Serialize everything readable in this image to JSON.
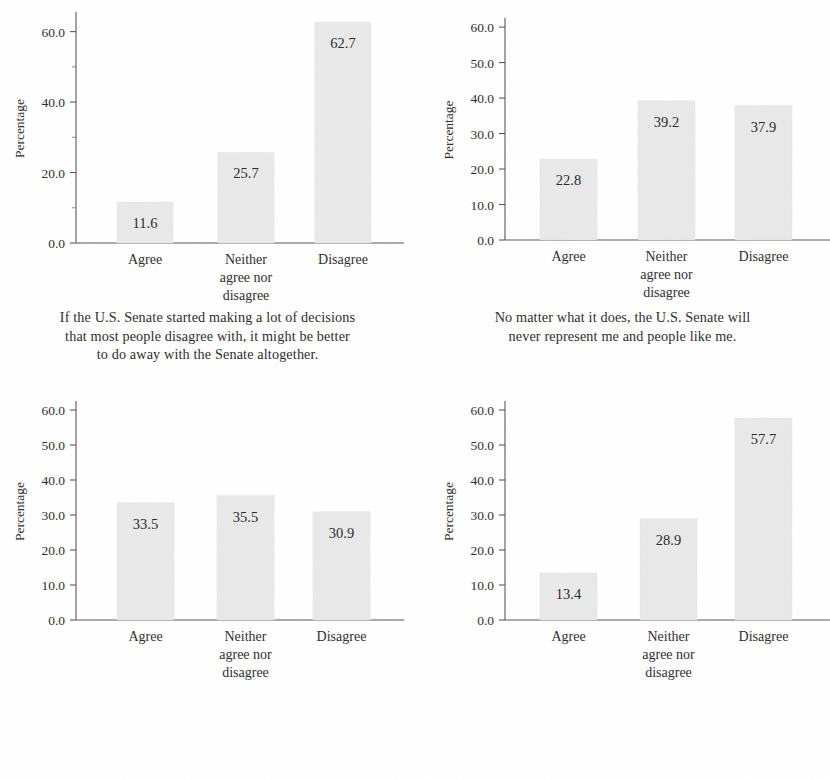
{
  "figure": {
    "background_color": "#ffffff",
    "bar_fill_color": "#e9e9e9",
    "axis_color": "#585858",
    "text_color": "#2e2e2e",
    "y_axis_title": "Percentage",
    "categories": [
      "Agree",
      "Neither agree nor disagree",
      "Disagree"
    ],
    "category_lines": [
      [
        "Agree"
      ],
      [
        "Neither",
        "agree nor",
        "disagree"
      ],
      [
        "Disagree"
      ]
    ]
  },
  "chart_data": [
    {
      "type": "bar",
      "panel": "top-left",
      "title": "",
      "caption": "If the U.S. Senate started making a lot of decisions that most people disagree with, it might be better to do away with the Senate altogether.",
      "caption_lines": [
        "If the U.S. Senate started making a lot of decisions",
        "that most people disagree with, it might be better",
        "to do away with the Senate altogether."
      ],
      "categories": [
        "Agree",
        "Neither agree nor disagree",
        "Disagree"
      ],
      "values": [
        11.6,
        25.7,
        62.7
      ],
      "value_labels": [
        "11.6",
        "25.7",
        "62.7"
      ],
      "xlabel": "",
      "ylabel": "Percentage",
      "ylim": [
        0,
        65
      ],
      "yticks": [
        0.0,
        20.0,
        40.0,
        60.0
      ],
      "ytick_labels": [
        "0.0",
        "20.0",
        "40.0",
        "60.0"
      ],
      "yminor_ticks": [
        10.0,
        30.0,
        50.0
      ],
      "grid": false,
      "legend": "none"
    },
    {
      "type": "bar",
      "panel": "top-right",
      "title": "",
      "caption": "No matter what it does, the U.S. Senate will never represent me and people like me.",
      "caption_lines": [
        "No matter what it does, the U.S. Senate will",
        "never represent me and people like me."
      ],
      "categories": [
        "Agree",
        "Neither agree nor disagree",
        "Disagree"
      ],
      "values": [
        22.8,
        39.2,
        37.9
      ],
      "value_labels": [
        "22.8",
        "39.2",
        "37.9"
      ],
      "xlabel": "",
      "ylabel": "Percentage",
      "ylim": [
        0,
        62
      ],
      "yticks": [
        0.0,
        10.0,
        20.0,
        30.0,
        40.0,
        50.0,
        60.0
      ],
      "ytick_labels": [
        "0.0",
        "10.0",
        "20.0",
        "30.0",
        "40.0",
        "50.0",
        "60.0"
      ],
      "yminor_ticks": [],
      "grid": false,
      "legend": "none"
    },
    {
      "type": "bar",
      "panel": "bottom-left",
      "title": "",
      "caption": "The country would be better off replacing every current U.S. Senator with someone new.",
      "caption_lines": [
        "The country would be better off replacing",
        "every current U.S. Senator with someone new."
      ],
      "categories": [
        "Agree",
        "Neither agree nor disagree",
        "Disagree"
      ],
      "values": [
        33.5,
        35.5,
        30.9
      ],
      "value_labels": [
        "33.5",
        "35.5",
        "30.9"
      ],
      "xlabel": "",
      "ylabel": "Percentage",
      "ylim": [
        0,
        62
      ],
      "yticks": [
        0.0,
        10.0,
        20.0,
        30.0,
        40.0,
        50.0,
        60.0
      ],
      "ytick_labels": [
        "0.0",
        "10.0",
        "20.0",
        "30.0",
        "40.0",
        "50.0",
        "60.0"
      ],
      "yminor_ticks": [],
      "grid": false,
      "legend": "none"
    },
    {
      "type": "bar",
      "panel": "bottom-right",
      "title": "",
      "caption": "The U.S. Senate ought to be changed so that for each state the number of senators and representatives in the U.S. Congress is the same—435 Representatives and 435 Senators.",
      "caption_lines": [
        "The U.S. Senate ought to be changed so that",
        "for each state the number of senators and",
        "representatives in the U.S. Congress is the",
        "same—435 Representatives and 435 Senators."
      ],
      "categories": [
        "Agree",
        "Neither agree nor disagree",
        "Disagree"
      ],
      "values": [
        13.4,
        28.9,
        57.7
      ],
      "value_labels": [
        "13.4",
        "28.9",
        "57.7"
      ],
      "xlabel": "",
      "ylabel": "Percentage",
      "ylim": [
        0,
        62
      ],
      "yticks": [
        0.0,
        10.0,
        20.0,
        30.0,
        40.0,
        50.0,
        60.0
      ],
      "ytick_labels": [
        "0.0",
        "10.0",
        "20.0",
        "30.0",
        "40.0",
        "50.0",
        "60.0"
      ],
      "yminor_ticks": [],
      "grid": false,
      "legend": "none"
    }
  ]
}
